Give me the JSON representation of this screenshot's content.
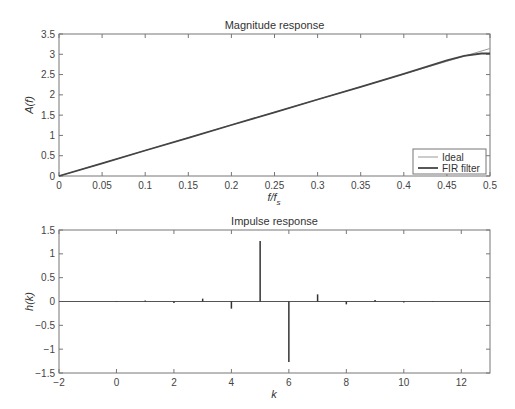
{
  "chart_data": [
    {
      "type": "line",
      "title": "Magnitude response",
      "xlabel": "f/f_s",
      "xlabel_main": "f/f",
      "xlabel_sub": "s",
      "ylabel": "A(f)",
      "xlim": [
        0,
        0.5
      ],
      "ylim": [
        0,
        3.5
      ],
      "xticks": [
        "0",
        "0.05",
        "0.1",
        "0.15",
        "0.2",
        "0.25",
        "0.3",
        "0.35",
        "0.4",
        "0.45",
        "0.5"
      ],
      "yticks": [
        "0",
        "0.5",
        "1",
        "1.5",
        "2",
        "2.5",
        "3",
        "3.5"
      ],
      "grid": false,
      "legend_position": "lower right",
      "series": [
        {
          "name": "Ideal",
          "color": "#999999",
          "x": [
            0,
            0.05,
            0.1,
            0.15,
            0.2,
            0.25,
            0.3,
            0.35,
            0.4,
            0.45,
            0.5
          ],
          "values": [
            0,
            0.314,
            0.628,
            0.942,
            1.257,
            1.571,
            1.885,
            2.199,
            2.513,
            2.827,
            3.142
          ]
        },
        {
          "name": "FIR filter",
          "color": "#444444",
          "x": [
            0,
            0.05,
            0.1,
            0.15,
            0.2,
            0.25,
            0.3,
            0.35,
            0.4,
            0.45,
            0.47,
            0.49,
            0.5
          ],
          "values": [
            0,
            0.314,
            0.628,
            0.942,
            1.257,
            1.571,
            1.885,
            2.199,
            2.52,
            2.85,
            2.96,
            3.02,
            3.02
          ]
        }
      ]
    },
    {
      "type": "stem",
      "title": "Impulse response",
      "xlabel": "k",
      "ylabel": "h(k)",
      "xlim": [
        -2,
        13
      ],
      "ylim": [
        -1.5,
        1.5
      ],
      "xticks": [
        "-2",
        "0",
        "2",
        "4",
        "6",
        "8",
        "10",
        "12"
      ],
      "yticks": [
        "-1.5",
        "-1",
        "-0.5",
        "0",
        "0.5",
        "1",
        "1.5"
      ],
      "grid": false,
      "x": [
        0,
        1,
        2,
        3,
        4,
        5,
        6,
        7,
        8,
        9,
        10,
        11
      ],
      "values": [
        -0.01,
        0.02,
        -0.03,
        0.06,
        -0.15,
        1.27,
        -1.27,
        0.15,
        -0.06,
        0.03,
        -0.02,
        0.01
      ]
    }
  ],
  "legend": {
    "items": [
      "Ideal",
      "FIR filter"
    ]
  }
}
